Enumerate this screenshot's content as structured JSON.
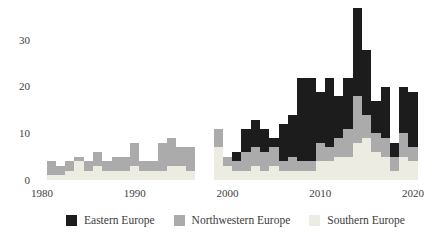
{
  "chart_data": {
    "type": "bar",
    "stacked": true,
    "title": "",
    "xlabel": "",
    "ylabel": "",
    "grid": false,
    "legend_position": "bottom",
    "ylim": [
      0,
      38
    ],
    "xlim": [
      1980,
      2021
    ],
    "y_ticks": [
      0,
      10,
      20,
      30
    ],
    "x_ticks": [
      1980,
      1990,
      2000,
      2010,
      2020
    ],
    "categories": [
      1981,
      1982,
      1983,
      1984,
      1985,
      1986,
      1987,
      1988,
      1989,
      1990,
      1991,
      1992,
      1993,
      1994,
      1995,
      1996,
      1997,
      1998,
      1999,
      2000,
      2001,
      2002,
      2003,
      2004,
      2005,
      2006,
      2007,
      2008,
      2009,
      2010,
      2011,
      2012,
      2013,
      2014,
      2015,
      2016,
      2017,
      2018,
      2019,
      2020
    ],
    "series": [
      {
        "name": "Southern Europe",
        "color": "#edece3",
        "values": [
          1,
          1,
          2,
          4,
          2,
          3,
          2,
          2,
          2,
          3,
          2,
          2,
          2,
          3,
          3,
          2,
          0,
          0,
          7,
          3,
          2,
          2,
          3,
          2,
          3,
          2,
          2,
          2,
          2,
          4,
          4,
          5,
          5,
          8,
          9,
          6,
          5,
          2,
          5,
          4
        ]
      },
      {
        "name": "Northwestern Europe",
        "color": "#ababab",
        "values": [
          3,
          2,
          2,
          1,
          2,
          3,
          2,
          3,
          3,
          5,
          2,
          2,
          6,
          6,
          4,
          5,
          0,
          0,
          4,
          2,
          2,
          4,
          4,
          4,
          4,
          2,
          3,
          2,
          2,
          4,
          3,
          4,
          6,
          10,
          5,
          4,
          4,
          3,
          5,
          3
        ]
      },
      {
        "name": "Eastern Europe",
        "color": "#1c1c1c",
        "values": [
          0,
          0,
          0,
          0,
          0,
          0,
          0,
          0,
          0,
          0,
          0,
          0,
          0,
          0,
          0,
          0,
          0,
          0,
          0,
          0,
          2,
          5,
          6,
          5,
          2,
          8,
          9,
          18,
          18,
          11,
          15,
          9,
          11,
          19,
          14,
          7,
          11,
          3,
          10,
          12
        ]
      }
    ]
  },
  "legend": {
    "items": [
      {
        "label": "Eastern Europe",
        "color": "#1c1c1c"
      },
      {
        "label": "Northwestern Europe",
        "color": "#ababab"
      },
      {
        "label": "Southern Europe",
        "color": "#edece3"
      }
    ]
  },
  "axis": {
    "text_color": "#3e3e3e"
  }
}
